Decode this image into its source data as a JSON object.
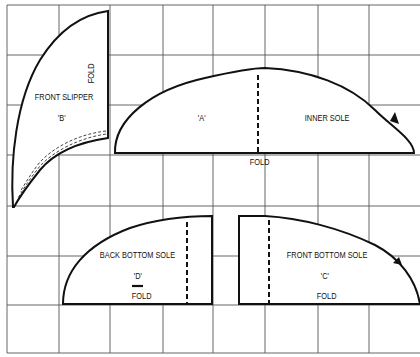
{
  "diagram": {
    "type": "sewing-pattern-grid",
    "grid": {
      "x_lines": [
        7,
        59,
        110,
        163,
        213,
        265,
        318,
        369,
        420
      ],
      "y_lines": [
        5,
        55,
        105,
        155,
        206,
        256,
        305,
        353
      ],
      "line_color": "#555555"
    },
    "pieces": {
      "front_slipper": {
        "name": "FRONT SLIPPER",
        "id": "'B'",
        "fold": "FOLD"
      },
      "inner_sole": {
        "name": "INNER SOLE",
        "id": "'A'",
        "fold": "FOLD"
      },
      "back_bottom_sole": {
        "name": "BACK BOTTOM SOLE",
        "id": "'D'",
        "fold": "FOLD"
      },
      "front_bottom_sole": {
        "name": "FRONT BOTTOM SOLE",
        "id": "'C'",
        "fold": "FOLD"
      }
    },
    "stroke_color": "#111111"
  }
}
